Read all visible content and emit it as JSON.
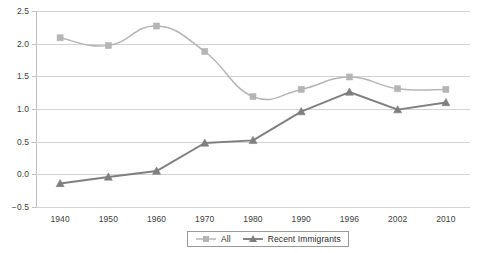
{
  "chart_data": {
    "type": "line",
    "title": "",
    "subtitle": "",
    "xlabel": "",
    "ylabel": "",
    "categories": [
      "1940",
      "1950",
      "1960",
      "1970",
      "1980",
      "1990",
      "1996",
      "2002",
      "2010"
    ],
    "ylim": [
      -0.5,
      2.5
    ],
    "ytick_labels": [
      "2.5",
      "2.0",
      "1.5",
      "1.0",
      "0.5",
      "0.0",
      "−0.5"
    ],
    "ytick_values": [
      2.5,
      2.0,
      1.5,
      1.0,
      0.5,
      0.0,
      -0.5
    ],
    "grid": true,
    "legend_position": "bottom-center",
    "series": [
      {
        "name": "All",
        "color": "#b5b5b5",
        "marker": "square",
        "smooth": true,
        "values": [
          2.09,
          1.97,
          2.27,
          1.88,
          1.19,
          1.3,
          1.49,
          1.31,
          1.3
        ]
      },
      {
        "name": "Recent Immigrants",
        "color": "#7f7f7f",
        "marker": "triangle",
        "smooth": false,
        "values": [
          -0.14,
          -0.04,
          0.05,
          0.48,
          0.52,
          0.96,
          1.26,
          0.99,
          1.1
        ]
      }
    ]
  },
  "legend": {
    "entries": [
      {
        "label": "All"
      },
      {
        "label": "Recent Immigrants"
      }
    ]
  },
  "colors": {
    "series_all": "#b5b5b5",
    "series_recent": "#7f7f7f",
    "gridline": "#d3d3d3",
    "axis": "#bfbfbf",
    "text": "#404040",
    "background": "#ffffff"
  }
}
